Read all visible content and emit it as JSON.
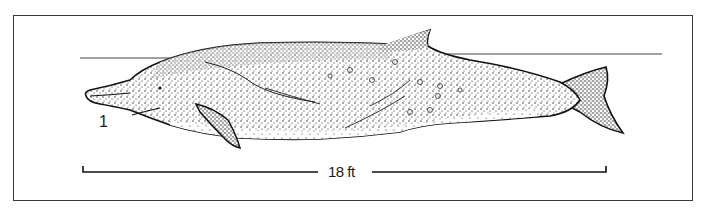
{
  "figure": {
    "figure_number": "1",
    "scale_bar": {
      "label": "18 ft",
      "value": 18,
      "unit": "ft"
    },
    "elements": [
      "frame-border",
      "waterline",
      "whale-body",
      "dorsal-fin",
      "flipper",
      "tail-fluke",
      "scale-bar"
    ],
    "colors": {
      "ink": "#1a1a1a",
      "background": "#ffffff",
      "frame": "#3a3a3a"
    }
  }
}
